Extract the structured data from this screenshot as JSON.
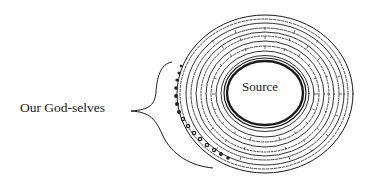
{
  "diagram": {
    "type": "concentric-spiral",
    "center_label": "Source",
    "side_label": "Our God-selves",
    "brace_target": "outer rings",
    "colors": {
      "ink": "#1a1a1a",
      "background": "#ffffff"
    },
    "rings": {
      "count": 9,
      "center": [
        265,
        94
      ],
      "inner_radius": [
        39,
        33
      ],
      "outer_radius": [
        88,
        79
      ]
    }
  }
}
